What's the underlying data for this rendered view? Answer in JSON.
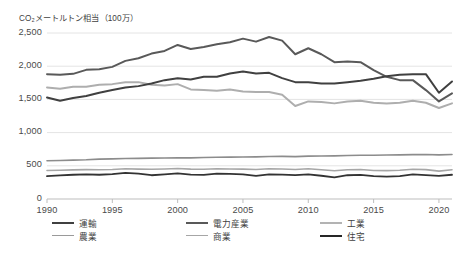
{
  "chart_data": {
    "type": "line",
    "title": "CO₂メートルトン相当（100万）",
    "xlabel": "",
    "ylabel": "",
    "ylim": [
      0,
      2500
    ],
    "yticks": [
      0,
      500,
      1000,
      1500,
      2000,
      2500
    ],
    "ytick_labels": [
      "0",
      "500",
      "1,000",
      "1,500",
      "2,000",
      "2,500"
    ],
    "xlim": [
      1990,
      2021
    ],
    "xticks": [
      1990,
      1995,
      2000,
      2005,
      2010,
      2015,
      2020
    ],
    "xtick_labels": [
      "1990",
      "1995",
      "2000",
      "2005",
      "2010",
      "2015",
      "2020"
    ],
    "grid": "horizontal",
    "legend_position": "bottom",
    "x": [
      1990,
      1991,
      1992,
      1993,
      1994,
      1995,
      1996,
      1997,
      1998,
      1999,
      2000,
      2001,
      2002,
      2003,
      2004,
      2005,
      2006,
      2007,
      2008,
      2009,
      2010,
      2011,
      2012,
      2013,
      2014,
      2015,
      2016,
      2017,
      2018,
      2019,
      2020,
      2021
    ],
    "series": [
      {
        "name": "電力産業",
        "key": "power",
        "color": "#595959",
        "width": 2.0,
        "values": [
          1880,
          1870,
          1885,
          1945,
          1955,
          1990,
          2080,
          2120,
          2190,
          2230,
          2320,
          2260,
          2290,
          2330,
          2360,
          2415,
          2370,
          2440,
          2385,
          2180,
          2270,
          2180,
          2060,
          2070,
          2060,
          1940,
          1840,
          1790,
          1790,
          1640,
          1470,
          1590
        ]
      },
      {
        "name": "運輸",
        "key": "transport",
        "color": "#404040",
        "width": 2.0,
        "values": [
          1530,
          1480,
          1520,
          1550,
          1600,
          1640,
          1680,
          1700,
          1740,
          1790,
          1820,
          1800,
          1840,
          1840,
          1890,
          1920,
          1890,
          1900,
          1820,
          1760,
          1760,
          1740,
          1740,
          1760,
          1780,
          1810,
          1850,
          1870,
          1880,
          1880,
          1600,
          1770
        ]
      },
      {
        "name": "工業",
        "key": "industry",
        "color": "#aeaeae",
        "width": 2.0,
        "values": [
          1680,
          1660,
          1690,
          1690,
          1720,
          1730,
          1760,
          1760,
          1720,
          1710,
          1730,
          1650,
          1640,
          1630,
          1650,
          1620,
          1610,
          1610,
          1570,
          1400,
          1470,
          1460,
          1440,
          1470,
          1480,
          1450,
          1440,
          1450,
          1480,
          1450,
          1370,
          1440
        ]
      },
      {
        "name": "農業",
        "key": "agriculture",
        "color": "#8c8c8c",
        "width": 1.6,
        "values": [
          575,
          580,
          585,
          590,
          600,
          605,
          610,
          612,
          615,
          618,
          622,
          620,
          625,
          628,
          630,
          632,
          635,
          640,
          642,
          638,
          645,
          648,
          650,
          655,
          660,
          658,
          662,
          665,
          668,
          670,
          665,
          670
        ]
      },
      {
        "name": "商業",
        "key": "commercial",
        "color": "#a6a6a6",
        "width": 1.6,
        "values": [
          430,
          432,
          438,
          442,
          440,
          445,
          455,
          450,
          448,
          452,
          460,
          450,
          448,
          455,
          452,
          450,
          445,
          455,
          452,
          445,
          455,
          440,
          425,
          440,
          445,
          430,
          428,
          432,
          448,
          442,
          420,
          440
        ]
      },
      {
        "name": "住宅",
        "key": "residential",
        "color": "#333333",
        "width": 1.8,
        "values": [
          345,
          355,
          365,
          372,
          365,
          375,
          392,
          382,
          358,
          370,
          385,
          368,
          362,
          382,
          378,
          372,
          348,
          372,
          368,
          360,
          372,
          350,
          325,
          358,
          362,
          345,
          338,
          345,
          372,
          360,
          348,
          365
        ]
      }
    ]
  },
  "legend": {
    "rows": [
      [
        {
          "label": "運輸",
          "key": "transport",
          "color": "#404040",
          "width": 2.2
        },
        {
          "label": "電力産業",
          "key": "power",
          "color": "#595959",
          "width": 2.2
        },
        {
          "label": "工業",
          "key": "industry",
          "color": "#b3b3b3",
          "width": 2.2
        }
      ],
      [
        {
          "label": "農業",
          "key": "agriculture",
          "color": "#9a9a9a",
          "width": 1.8
        },
        {
          "label": "商業",
          "key": "commercial",
          "color": "#a6a6a6",
          "width": 1.8
        },
        {
          "label": "住宅",
          "key": "residential",
          "color": "#262626",
          "width": 2.6
        }
      ]
    ]
  },
  "plot_geometry": {
    "left": 47,
    "right": 452,
    "top": 33,
    "bottom": 199,
    "grid_color": "#e4e4e4",
    "axis_color": "#bdbdbd"
  }
}
